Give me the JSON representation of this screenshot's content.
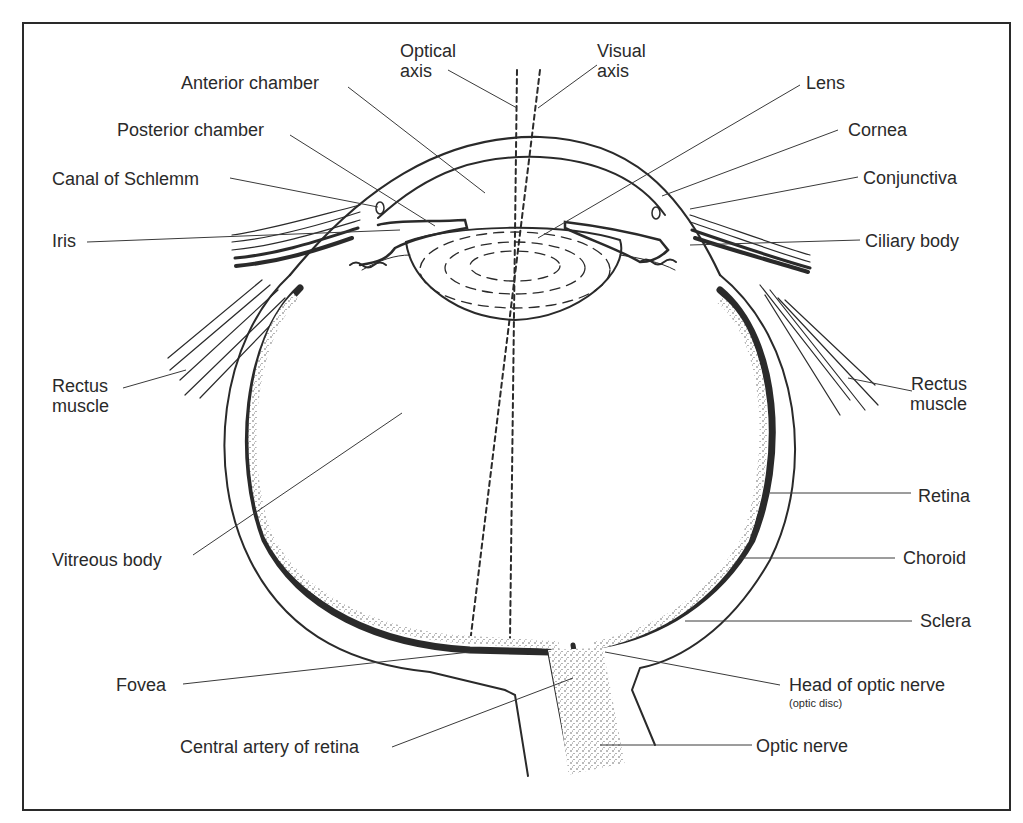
{
  "figure": {
    "colors": {
      "ink": "#2a2a2a",
      "background": "#ffffff"
    }
  },
  "labels": {
    "optical_axis": [
      "Optical",
      "axis"
    ],
    "visual_axis": [
      "Visual",
      "axis"
    ],
    "anterior_chamber": "Anterior chamber",
    "posterior_chamber": "Posterior chamber",
    "canal_of_schlemm": "Canal of Schlemm",
    "iris": "Iris",
    "lens": "Lens",
    "cornea": "Cornea",
    "conjunctiva": "Conjunctiva",
    "ciliary_body": "Ciliary body",
    "rectus_muscle_left": [
      "Rectus",
      "muscle"
    ],
    "rectus_muscle_right": [
      "Rectus",
      "muscle"
    ],
    "vitreous_body": "Vitreous body",
    "retina": "Retina",
    "choroid": "Choroid",
    "sclera": "Sclera",
    "fovea": "Fovea",
    "head_of_optic_nerve": "Head of optic nerve",
    "optic_disc": "(optic disc)",
    "central_artery_of_retina": "Central artery of retina",
    "optic_nerve": "Optic nerve"
  }
}
